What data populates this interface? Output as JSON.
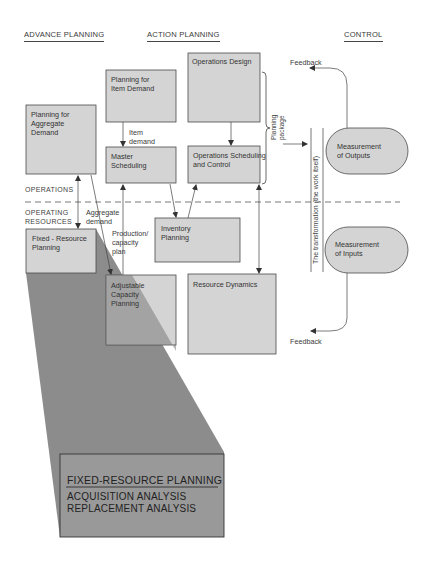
{
  "headers": {
    "advance_planning": "ADVANCE PLANNING",
    "action_planning": "ACTION PLANNING",
    "control": "CONTROL"
  },
  "boxes": {
    "planning_item_demand": [
      "Planning for",
      "Item Demand"
    ],
    "operations_design": [
      "Operations Design"
    ],
    "planning_aggregate_demand": [
      "Planning for",
      "Aggregate",
      "Demand"
    ],
    "master_scheduling": [
      "Master",
      "Scheduling"
    ],
    "operations_scheduling": [
      "Operations Scheduling",
      "and Control"
    ],
    "fixed_resource_planning": [
      "Fixed - Resource",
      "Planning"
    ],
    "inventory_planning": [
      "Inventory",
      "Planning"
    ],
    "adjustable_capacity_planning": [
      "Adjustable",
      "Capacity",
      "Planning"
    ],
    "resource_dynamics": [
      "Resource Dynamics"
    ],
    "measurement_outputs": [
      "Measurement",
      "of Outputs"
    ],
    "measurement_inputs": [
      "Measurement",
      "of Inputs"
    ]
  },
  "labels": {
    "item_demand": [
      "Item",
      "demand"
    ],
    "aggregate_demand": [
      "Aggregate",
      "demand"
    ],
    "production_capacity_plan": [
      "Production/",
      "capacity",
      "plan"
    ],
    "operations": "OPERATIONS",
    "operating_resources": [
      "OPERATING",
      "RESOURCES"
    ],
    "planning_package": [
      "Planning",
      "package"
    ],
    "transformation": "The transformation (the work itself)",
    "feedback_top": "Feedback",
    "feedback_bottom": "Feedback"
  },
  "callout": {
    "title": "FIXED-RESOURCE PLANNING",
    "items": [
      "ACQUISITION ANALYSIS",
      "REPLACEMENT ANALYSIS"
    ]
  },
  "colors": {
    "box_fill": "#d4d4d4",
    "box_stroke": "#4a4a4a",
    "shade": "#8c8c8c",
    "callout_fill": "#999999"
  }
}
